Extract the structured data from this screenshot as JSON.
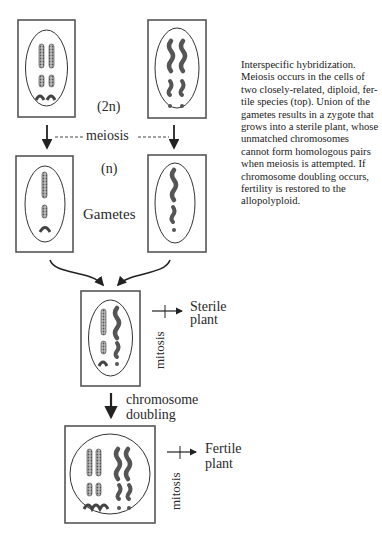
{
  "labels": {
    "diploid": "(2n)",
    "meiosis": "meiosis",
    "haploid": "(n)",
    "gametes": "Gametes",
    "mitosis_1": "mitosis",
    "sterile_line1": "Sterile",
    "sterile_line2": "plant",
    "doubling_line1": "chromosome",
    "doubling_line2": "doubling",
    "mitosis_2": "mitosis",
    "fertile_line1": "Fertile",
    "fertile_line2": "plant"
  },
  "caption_lines": [
    "Interspecific hybridization.",
    "Meiosis occurs in the cells of",
    "two closely-related, diploid, fer-",
    "tile species (top). Union of the",
    "gametes results in a zygote that",
    "grows into a sterile plant, whose",
    "unmatched chromosomes",
    "cannot form homologous pairs",
    "when meiosis is attempted. If",
    "chromosome doubling occurs,",
    "fertility is restored to the",
    "allopolyploid."
  ],
  "cells": [
    {
      "name": "species-a-diploid-cell",
      "ploidy": "2n",
      "species": "A"
    },
    {
      "name": "species-b-diploid-cell",
      "ploidy": "2n",
      "species": "B"
    },
    {
      "name": "species-a-gamete",
      "ploidy": "n",
      "species": "A"
    },
    {
      "name": "species-b-gamete",
      "ploidy": "n",
      "species": "B"
    },
    {
      "name": "hybrid-zygote-cell",
      "ploidy": "hybrid",
      "species": "A+B"
    },
    {
      "name": "allopolyploid-cell",
      "ploidy": "doubled",
      "species": "A+B"
    }
  ],
  "colors": {
    "ink": "#2b2b2b",
    "frame": "#555555",
    "chromosome_fill": "#9a9a9a"
  }
}
